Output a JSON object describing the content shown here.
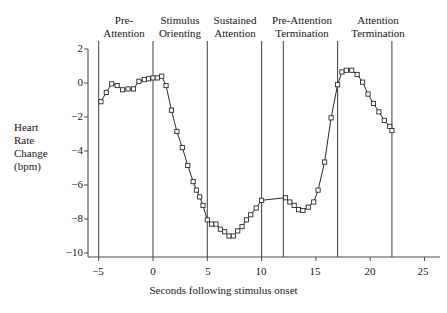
{
  "chart_data": {
    "type": "line",
    "title": "",
    "xlabel": "Seconds following stimulus onset",
    "ylabel": "Heart Rate Change (bpm)",
    "ylabel_lines": [
      "Heart",
      "Rate",
      "Change",
      "(bpm)"
    ],
    "xlim": [
      -5.6,
      26.0
    ],
    "ylim": [
      -10.6,
      2.4
    ],
    "xticks": [
      -5,
      0,
      5,
      10,
      15,
      20,
      25
    ],
    "xtick_labels": [
      "−5",
      "0",
      "5",
      "10",
      "15",
      "20",
      "25"
    ],
    "yticks": [
      2,
      0,
      -2,
      -4,
      -6,
      -8,
      -10
    ],
    "ytick_labels": [
      "2",
      "0",
      "−2",
      "−4",
      "−6",
      "−8",
      "−10"
    ],
    "grid": false,
    "legend": null,
    "marker": "open-square",
    "line_color": "#2a2a2a",
    "phase_dividers": [
      -5,
      0,
      5,
      10,
      12,
      17,
      22
    ],
    "phases": [
      {
        "name": "pre-attention",
        "lines": [
          "Pre-",
          "Attention"
        ],
        "start": -5,
        "end": 0
      },
      {
        "name": "stimulus-orienting",
        "lines": [
          "Stimulus",
          "Orienting"
        ],
        "start": 0,
        "end": 5
      },
      {
        "name": "sustained-attention",
        "lines": [
          "Sustained",
          "Attention"
        ],
        "start": 5,
        "end": 10
      },
      {
        "name": "pre-attention-termination",
        "lines": [
          "Pre-Attention",
          "Termination"
        ],
        "start": 10,
        "end": 12
      },
      {
        "name": "attention-termination",
        "lines": [
          "Attention",
          "Termination"
        ],
        "start": 12,
        "end": 22
      }
    ],
    "x": [
      -4.8,
      -4.3,
      -3.8,
      -3.3,
      -2.8,
      -2.3,
      -1.8,
      -1.3,
      -0.8,
      -0.4,
      0.0,
      0.4,
      0.8,
      1.2,
      1.7,
      2.2,
      2.7,
      3.2,
      3.7,
      4.0,
      4.3,
      4.6,
      5.0,
      5.4,
      5.8,
      6.2,
      6.6,
      7.0,
      7.4,
      7.8,
      8.2,
      8.6,
      9.0,
      9.5,
      10.0,
      12.2,
      12.6,
      13.0,
      13.4,
      13.8,
      14.3,
      14.8,
      15.2,
      15.8,
      16.4,
      17.0,
      17.4,
      17.8,
      18.3,
      18.8,
      19.3,
      19.8,
      20.3,
      20.8,
      21.3,
      21.8,
      22.0
    ],
    "y": [
      -1.1,
      -0.55,
      -0.05,
      -0.15,
      -0.4,
      -0.35,
      -0.35,
      0.1,
      0.2,
      0.25,
      0.3,
      0.3,
      0.4,
      -0.15,
      -1.6,
      -2.85,
      -3.8,
      -4.85,
      -5.8,
      -6.3,
      -6.7,
      -7.2,
      -8.05,
      -8.3,
      -8.3,
      -8.6,
      -8.75,
      -9.0,
      -9.0,
      -8.7,
      -8.45,
      -8.05,
      -7.75,
      -7.35,
      -6.9,
      -6.75,
      -7.0,
      -7.2,
      -7.45,
      -7.5,
      -7.3,
      -7.0,
      -6.3,
      -4.65,
      -2.05,
      -0.1,
      0.65,
      0.75,
      0.75,
      0.5,
      0.05,
      -0.65,
      -1.2,
      -1.7,
      -2.2,
      -2.55,
      -2.8
    ]
  }
}
